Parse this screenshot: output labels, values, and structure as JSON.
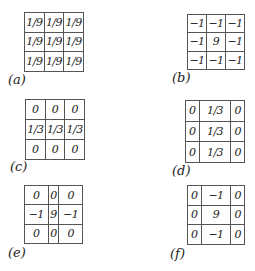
{
  "figure": {
    "panels": [
      {
        "label": "(a)",
        "cells": [
          [
            "1/9",
            "1/9",
            "1/9"
          ],
          [
            "1/9",
            "1/9",
            "1/9"
          ],
          [
            "1/9",
            "1/9",
            "1/9"
          ]
        ]
      },
      {
        "label": "(b)",
        "cells": [
          [
            "−1",
            "−1",
            "−1"
          ],
          [
            "−1",
            "9",
            "−1"
          ],
          [
            "−1",
            "−1",
            "−1"
          ]
        ]
      },
      {
        "label": "(c)",
        "cells": [
          [
            "0",
            "0",
            "0"
          ],
          [
            "1/3",
            "1/3",
            "1/3"
          ],
          [
            "0",
            "0",
            "0"
          ]
        ]
      },
      {
        "label": "(d)",
        "cells": [
          [
            "0",
            "1/3",
            "0"
          ],
          [
            "0",
            "1/3",
            "0"
          ],
          [
            "0",
            "1/3",
            "0"
          ]
        ]
      },
      {
        "label": "(e)",
        "cells": [
          [
            "0",
            "0",
            "0"
          ],
          [
            "−1",
            "9",
            "−1"
          ],
          [
            "0",
            "0",
            "0"
          ]
        ]
      },
      {
        "label": "(f)",
        "cells": [
          [
            "0",
            "−1",
            "0"
          ],
          [
            "0",
            "9",
            "0"
          ],
          [
            "0",
            "−1",
            "0"
          ]
        ]
      }
    ]
  }
}
